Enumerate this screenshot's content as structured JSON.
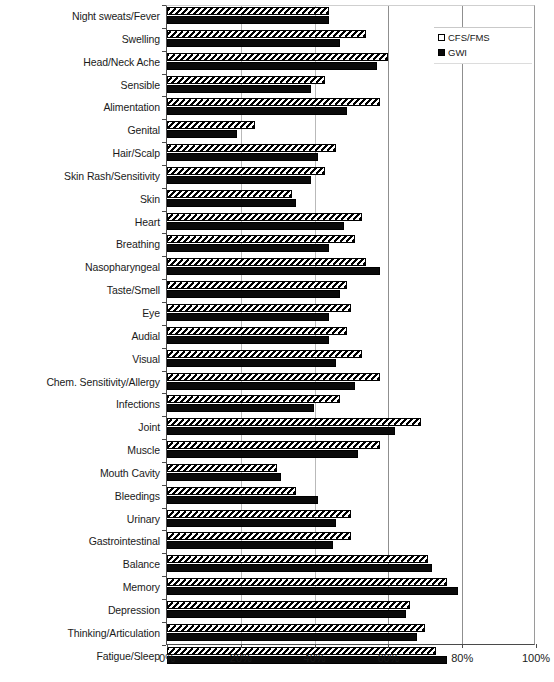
{
  "chart_data": {
    "type": "bar",
    "orientation": "horizontal",
    "title": "",
    "xlabel": "",
    "ylabel": "",
    "xlim": [
      0,
      100
    ],
    "xticks": [
      "0%",
      "20%",
      "40%",
      "60%",
      "80%",
      "100%"
    ],
    "xtick_values": [
      0,
      20,
      40,
      60,
      80,
      100
    ],
    "grid": true,
    "legend_position": "top-right",
    "legend": [
      "CFS/FMS",
      "GWI"
    ],
    "categories": [
      "Night sweats/Fever",
      "Swelling",
      "Head/Neck Ache",
      "Sensible",
      "Alimentation",
      "Genital",
      "Hair/Scalp",
      "Skin Rash/Sensitivity",
      "Skin",
      "Heart",
      "Breathing",
      "Nasopharyngeal",
      "Taste/Smell",
      "Eye",
      "Audial",
      "Visual",
      "Chem. Sensitivity/Allergy",
      "Infections",
      "Joint",
      "Muscle",
      "Mouth Cavity",
      "Bleedings",
      "Urinary",
      "Gastrointestinal",
      "Balance",
      "Memory",
      "Depression",
      "Thinking/Articulation",
      "Fatigue/Sleep"
    ],
    "series": [
      {
        "name": "CFS/FMS",
        "pattern": "hatched",
        "color": "#ffffff",
        "values": [
          44,
          54,
          60,
          43,
          58,
          24,
          46,
          43,
          34,
          53,
          51,
          54,
          49,
          50,
          49,
          53,
          58,
          47,
          69,
          58,
          30,
          35,
          50,
          50,
          71,
          76,
          66,
          70,
          73
        ]
      },
      {
        "name": "GWI",
        "pattern": "solid",
        "color": "#0a0a0a",
        "values": [
          44,
          47,
          57,
          39,
          49,
          19,
          41,
          39,
          35,
          48,
          44,
          58,
          47,
          44,
          44,
          46,
          51,
          40,
          62,
          52,
          31,
          41,
          46,
          45,
          72,
          79,
          65,
          68,
          76
        ]
      }
    ]
  }
}
